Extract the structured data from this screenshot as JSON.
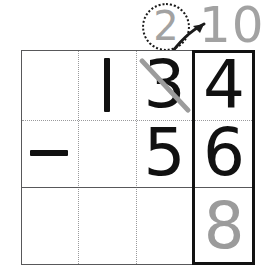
{
  "worksheet": {
    "type": "vertical-subtraction-with-regrouping",
    "title": "134 minus 56 regrouping worksheet",
    "colors": {
      "ink": "#111111",
      "pencil_gray": "#9b9b9b",
      "grid_line": "#58585a",
      "grid_dotted": "#9a9a9c",
      "highlight_border": "#111111"
    },
    "grid": {
      "columns": 4,
      "rows": 3,
      "column_labels": [
        "operator",
        "hundreds",
        "tens",
        "ones"
      ]
    },
    "rows": {
      "minuend": {
        "operator": "",
        "hundreds": "1",
        "tens": "3",
        "ones": "4",
        "value": "134"
      },
      "subtrahend": {
        "operator": "−",
        "hundreds": "",
        "tens": "5",
        "ones": "6",
        "value": "56"
      },
      "answer": {
        "operator": "",
        "hundreds": "",
        "tens": "",
        "ones": "8"
      }
    },
    "regrouping": {
      "crossed_out_digit": "3",
      "circled_new_tens_value": "2",
      "borrowed_ones_value": "10",
      "arrow": "curved-arrow-pointing-to-ones-column"
    }
  }
}
